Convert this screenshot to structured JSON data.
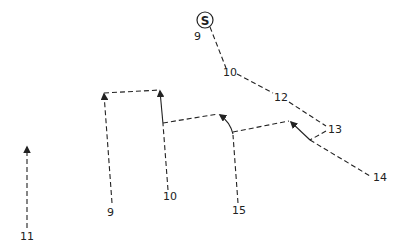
{
  "diagram": {
    "start_marker": "S",
    "labels": {
      "start_time": "9",
      "p10_top": "10",
      "p12": "12",
      "p13": "13",
      "p14": "14",
      "p9_bottom": "9",
      "p10_bottom": "10",
      "p15": "15",
      "p11": "11"
    }
  }
}
